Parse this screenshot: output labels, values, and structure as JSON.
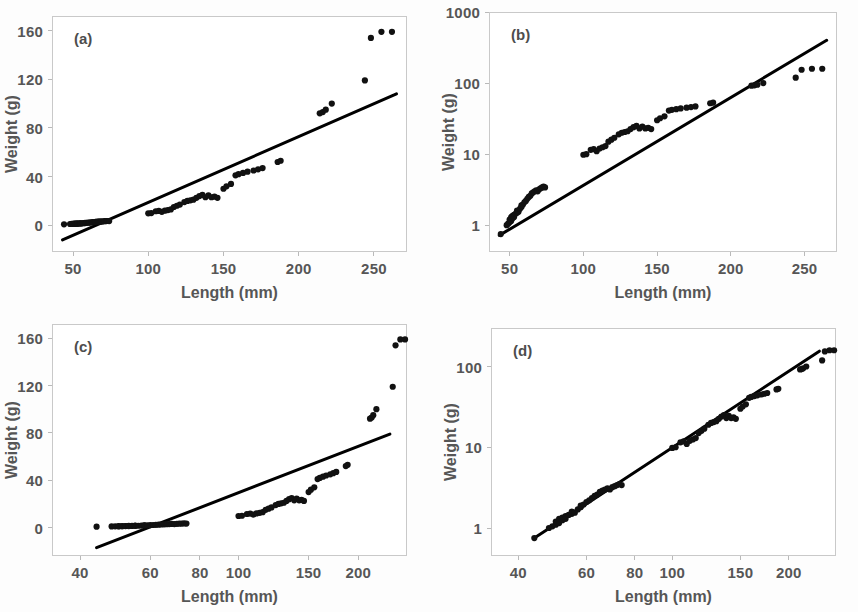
{
  "figure": {
    "background_color": "#fdfdfd",
    "frame_color": "#c9c9c9",
    "point_color": "#111111",
    "line_color": "#000000",
    "text_color": "#565656"
  },
  "panels": [
    {
      "key": "a",
      "label": "(a)",
      "xlabel": "Length (mm)",
      "ylabel": "Weight (g)",
      "xscale": "linear",
      "yscale": "linear",
      "xticks": [
        50,
        100,
        150,
        200,
        250
      ],
      "xticklabels": [
        "50",
        "100",
        "150",
        "200",
        "250"
      ],
      "yticks": [
        0,
        40,
        80,
        120,
        160
      ],
      "yticklabels": [
        "0",
        "40",
        "80",
        "120",
        "160"
      ],
      "xlim": [
        36,
        272
      ],
      "ylim": [
        -22,
        172
      ],
      "fit_line": {
        "x0": 43,
        "y0": -12,
        "x1": 265,
        "y1": 108
      }
    },
    {
      "key": "b",
      "label": "(b)",
      "xlabel": "Length (mm)",
      "ylabel": "Weight (g)",
      "xscale": "linear",
      "yscale": "log",
      "xticks": [
        50,
        100,
        150,
        200,
        250
      ],
      "xticklabels": [
        "50",
        "100",
        "150",
        "200",
        "250"
      ],
      "yticks": [
        1,
        10,
        100,
        1000
      ],
      "yticklabels": [
        "1",
        "10",
        "100",
        "1000"
      ],
      "xlim": [
        36,
        272
      ],
      "ylim": [
        0.42,
        1000
      ],
      "fit_line": {
        "x0": 43,
        "y0": 0.72,
        "x1": 265,
        "y1": 400
      }
    },
    {
      "key": "c",
      "label": "(c)",
      "xlabel": "Length (mm)",
      "ylabel": "Weight (g)",
      "xscale": "log",
      "yscale": "linear",
      "xticks": [
        40,
        60,
        80,
        100,
        150,
        200
      ],
      "xticklabels": [
        "40",
        "60",
        "80",
        "100",
        "150",
        "200"
      ],
      "yticks": [
        0,
        40,
        80,
        120,
        160
      ],
      "yticklabels": [
        "0",
        "40",
        "80",
        "120",
        "160"
      ],
      "xlim": [
        34,
        265
      ],
      "ylim": [
        -24,
        172
      ],
      "fit_line": {
        "x0": 44,
        "y0": -17,
        "x1": 240,
        "y1": 79
      }
    },
    {
      "key": "d",
      "label": "(d)",
      "xlabel": "Length (mm)",
      "ylabel": "Weight (g)",
      "xscale": "log",
      "yscale": "log",
      "xticks": [
        40,
        60,
        80,
        100,
        150,
        200
      ],
      "xticklabels": [
        "40",
        "60",
        "80",
        "100",
        "150",
        "200"
      ],
      "yticks": [
        1,
        10,
        100
      ],
      "yticklabels": [
        "1",
        "10",
        "100"
      ],
      "xlim": [
        34,
        265
      ],
      "ylim": [
        0.45,
        300
      ],
      "fit_line": {
        "x0": 44,
        "y0": 0.75,
        "x1": 240,
        "y1": 155
      }
    }
  ],
  "chart_data": {
    "type": "scatter",
    "title": "",
    "xlabel": "Length (mm)",
    "ylabel": "Weight (g)",
    "panels": [
      {
        "key": "a",
        "label": "(a)",
        "xscale": "linear",
        "yscale": "linear",
        "xlim": [
          36,
          272
        ],
        "ylim": [
          -22,
          172
        ],
        "grid": false,
        "xticks": [
          50,
          100,
          150,
          200,
          250
        ],
        "yticks": [
          0,
          40,
          80,
          120,
          160
        ],
        "fit_line": {
          "x0": 43,
          "y0": -12,
          "x1": 265,
          "y1": 108
        }
      },
      {
        "key": "b",
        "label": "(b)",
        "xscale": "linear",
        "yscale": "log",
        "xlim": [
          36,
          272
        ],
        "ylim": [
          0.42,
          1000
        ],
        "grid": false,
        "xticks": [
          50,
          100,
          150,
          200,
          250
        ],
        "yticks": [
          1,
          10,
          100,
          1000
        ],
        "fit_line": {
          "x0": 43,
          "y0": 0.72,
          "x1": 265,
          "y1": 400
        }
      },
      {
        "key": "c",
        "label": "(c)",
        "xscale": "log",
        "yscale": "linear",
        "xlim": [
          34,
          265
        ],
        "ylim": [
          -24,
          172
        ],
        "grid": false,
        "xticks": [
          40,
          60,
          80,
          100,
          150,
          200
        ],
        "yticks": [
          0,
          40,
          80,
          120,
          160
        ],
        "fit_line": {
          "x0": 44,
          "y0": -17,
          "x1": 240,
          "y1": 79
        }
      },
      {
        "key": "d",
        "label": "(d)",
        "xscale": "log",
        "yscale": "log",
        "xlim": [
          34,
          265
        ],
        "ylim": [
          0.45,
          300
        ],
        "grid": false,
        "xticks": [
          40,
          60,
          80,
          100,
          150,
          200
        ],
        "yticks": [
          1,
          10,
          100
        ],
        "fit_line": {
          "x0": 44,
          "y0": 0.75,
          "x1": 240,
          "y1": 155
        }
      }
    ],
    "x": [
      44,
      48,
      49,
      50,
      50,
      51,
      51,
      52,
      52,
      53,
      53,
      54,
      55,
      55,
      56,
      57,
      58,
      58,
      59,
      60,
      61,
      62,
      63,
      64,
      65,
      66,
      67,
      68,
      69,
      70,
      71,
      72,
      73,
      74,
      100,
      102,
      105,
      107,
      109,
      111,
      113,
      115,
      117,
      119,
      121,
      124,
      126,
      128,
      130,
      132,
      134,
      136,
      138,
      140,
      142,
      144,
      146,
      150,
      152,
      155,
      158,
      160,
      163,
      166,
      170,
      173,
      176,
      186,
      188,
      214,
      216,
      218,
      222,
      244,
      248,
      255,
      262
    ],
    "y": [
      0.75,
      1.0,
      1.05,
      1.1,
      1.2,
      1.15,
      1.3,
      1.25,
      1.35,
      1.4,
      1.3,
      1.45,
      1.5,
      1.6,
      1.55,
      1.7,
      1.8,
      1.9,
      1.95,
      2.1,
      2.2,
      2.35,
      2.5,
      2.6,
      2.8,
      2.9,
      3.0,
      3.1,
      3.0,
      3.2,
      3.3,
      3.4,
      3.5,
      3.4,
      9.8,
      10.0,
      11.5,
      11.8,
      11.0,
      12.0,
      12.5,
      13.0,
      15.0,
      16.0,
      17.0,
      19.0,
      20.0,
      20.5,
      21.0,
      22.5,
      24.0,
      25.0,
      23.0,
      24.5,
      23.0,
      23.5,
      22.5,
      30.0,
      32.0,
      34.0,
      41.0,
      42.0,
      43.0,
      44.0,
      45.0,
      46.0,
      47.0,
      52.0,
      53.0,
      92.0,
      93.0,
      95.0,
      100.0,
      119.0,
      154.0,
      159.0,
      159.0
    ],
    "n_points": 77,
    "units": {
      "x": "mm",
      "y": "g"
    }
  }
}
